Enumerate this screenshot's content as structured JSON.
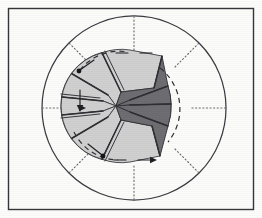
{
  "figure": {
    "type": "technical-line-diagram",
    "orientation": "plan view",
    "background_color": "#fdfdfc",
    "frame": {
      "name": "outer frame border",
      "stroke_color": "#35353a",
      "x": 8,
      "y": 8,
      "width": 246,
      "height": 202
    },
    "outer_circle": {
      "name": "outer boundary circle",
      "center_x": 134,
      "center_y": 108,
      "radius": 92,
      "stroke_color": "#3a3a40"
    },
    "hub": {
      "name": "impeller hub disc",
      "center_x": 116,
      "center_y": 106,
      "radius": 55,
      "fill_color": "#d2d2d2",
      "stroke_color": "#4a4a4f"
    },
    "radial_axes": {
      "name": "dotted radial centerlines",
      "count": 8,
      "style": "dotted",
      "color": "#6d6d72",
      "angles_deg": [
        0,
        45,
        90,
        135,
        180,
        225,
        270,
        315
      ],
      "inner_radius": 58,
      "outer_radius": 92
    },
    "blades": {
      "count": 8,
      "light_fill": "#d0d0d0",
      "dark_fill": "#6e6e72",
      "edge_color": "#2e2e33",
      "sector_span_deg": 45,
      "items": [
        {
          "index": 0,
          "angle_deg": 247,
          "shade": "light",
          "label": "blade-1"
        },
        {
          "index": 1,
          "angle_deg": 292,
          "shade": "light",
          "label": "blade-2"
        },
        {
          "index": 2,
          "angle_deg": 337,
          "shade": "dark",
          "label": "blade-3"
        },
        {
          "index": 3,
          "angle_deg": 22,
          "shade": "dark",
          "label": "blade-4"
        },
        {
          "index": 4,
          "angle_deg": 67,
          "shade": "dark",
          "label": "blade-5"
        },
        {
          "index": 5,
          "angle_deg": 112,
          "shade": "light",
          "label": "blade-6"
        },
        {
          "index": 6,
          "angle_deg": 157,
          "shade": "light",
          "label": "blade-7"
        },
        {
          "index": 7,
          "angle_deg": 202,
          "shade": "light",
          "label": "blade-8"
        }
      ]
    },
    "motion_arcs": {
      "name": "dashed rotation arcs",
      "style": "dashed",
      "color": "#2f2f34",
      "count": 3
    },
    "flow_arrows": {
      "name": "flow direction arrows",
      "color": "#1f1f24",
      "count": 7,
      "direction": "tangential"
    }
  }
}
